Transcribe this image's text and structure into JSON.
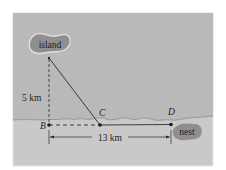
{
  "figure": {
    "labels": {
      "island": "island",
      "nest": "nest",
      "point_b": "B",
      "point_c": "C",
      "point_d": "D",
      "vertical_distance": "5 km",
      "horizontal_distance": "13 km"
    },
    "colors": {
      "frame_border": "#e6e6e6",
      "water": "#b9b9b9",
      "land": "#c9c9c9",
      "shoreline": "#8e8e8e",
      "island_fill": "#8f8f8f",
      "island_outline": "#dcdcdc",
      "nest_fill": "#8f8f8f",
      "line": "#2a2a2a",
      "text": "#1e1e1e"
    }
  }
}
